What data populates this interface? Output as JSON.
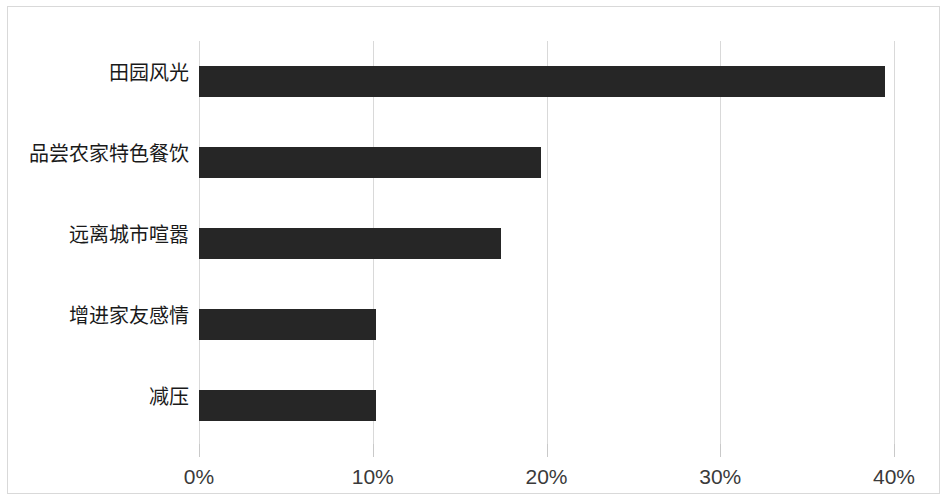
{
  "chart_data": {
    "type": "bar",
    "orientation": "horizontal",
    "title": "",
    "subtitle": "",
    "xlabel": "",
    "ylabel": "",
    "categories": [
      "田园风光",
      "品尝农家特色餐饮",
      "远离城市喧嚣",
      "增进家友感情",
      "减压"
    ],
    "values": [
      39.5,
      19.7,
      17.4,
      10.2,
      10.2
    ],
    "value_format": "percent",
    "xlim": [
      0,
      40
    ],
    "xticks": [
      0,
      10,
      20,
      30,
      40
    ],
    "xtick_labels": [
      "0%",
      "10%",
      "20%",
      "30%",
      "40%"
    ],
    "grid": {
      "vertical": true,
      "horizontal": false
    },
    "legend": {
      "visible": false,
      "position": "none"
    },
    "colors": {
      "bar": "#262626",
      "gridline": "#d9d9d9",
      "border": "#d9d9d9",
      "tick_text": "#3a3a3a",
      "category_text": "#1a1a1a",
      "background": "#ffffff"
    },
    "data_labels": {
      "visible": false
    }
  }
}
